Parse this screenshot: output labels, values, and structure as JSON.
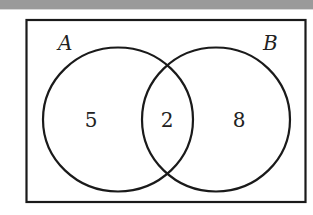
{
  "diagram": {
    "type": "venn",
    "sets": [
      {
        "label": "A",
        "only_count": "5"
      },
      {
        "label": "B",
        "only_count": "8"
      }
    ],
    "intersection_count": "2",
    "colors": {
      "stroke": "#1a1a1a",
      "background": "#ffffff",
      "top_bar": "#9a9a9a"
    }
  }
}
